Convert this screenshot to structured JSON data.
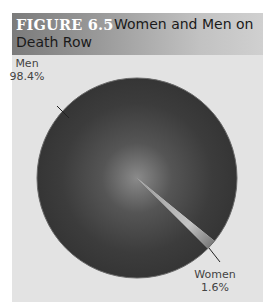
{
  "figure": {
    "number": "FIGURE 6.5",
    "title_line1": "Women and Men on",
    "title_line2": "Death Row",
    "header_colors": [
      "#7b7b7b",
      "#d0d0d0"
    ],
    "panel_bg": "#e3e3e3"
  },
  "chart_data": {
    "type": "pie",
    "title": "Women and Men on Death Row",
    "categories": [
      "Men",
      "Women"
    ],
    "values": [
      98.4,
      1.6
    ],
    "unit": "%",
    "labels": [
      {
        "name": "Men",
        "value": "98.4%"
      },
      {
        "name": "Women",
        "value": "1.6%"
      }
    ],
    "colors": {
      "Men": "#3a3a3a",
      "Women": "#b0b0b0"
    }
  }
}
